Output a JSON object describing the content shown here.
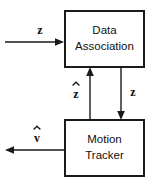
{
  "diagram": {
    "type": "block-diagram",
    "canvas": {
      "width": 158,
      "height": 183,
      "background": "#ffffff"
    },
    "stroke_color": "#1a1a1a",
    "blocks": [
      {
        "id": "data-association",
        "line1": "Data",
        "line2": "Association",
        "x": 64,
        "y": 10,
        "w": 81,
        "h": 58
      },
      {
        "id": "motion-tracker",
        "line1": "Motion",
        "line2": "Tracker",
        "x": 64,
        "y": 119,
        "w": 81,
        "h": 58
      }
    ],
    "signals": [
      {
        "id": "measurement-input",
        "label": "z",
        "hat": false,
        "direction": "right",
        "label_x": 40,
        "label_y": 31
      },
      {
        "id": "association-feedback",
        "label": "z",
        "hat": true,
        "direction": "up",
        "label_x": 76,
        "label_y": 93
      },
      {
        "id": "associated-measurement",
        "label": "z",
        "hat": false,
        "direction": "down",
        "label_x": 133,
        "label_y": 93
      },
      {
        "id": "velocity-output",
        "label": "v",
        "hat": true,
        "direction": "left",
        "label_x": 37,
        "label_y": 137
      }
    ]
  }
}
